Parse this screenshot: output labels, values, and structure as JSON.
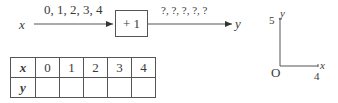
{
  "function_machine": {
    "input_var": "x",
    "input_values": "0, 1, 2, 3, 4",
    "rule": "+ 1",
    "output_values": "?, ?, ?, ?, ?",
    "output_var": "y"
  },
  "table": {
    "row_x_label": "x",
    "row_y_label": "y",
    "x_values": [
      "0",
      "1",
      "2",
      "3",
      "4"
    ],
    "y_values": [
      "",
      "",
      "",
      "",
      ""
    ]
  },
  "axes": {
    "y_label": "y",
    "x_label": "x",
    "origin_label": "O",
    "y_max": "5",
    "x_max": "4"
  }
}
